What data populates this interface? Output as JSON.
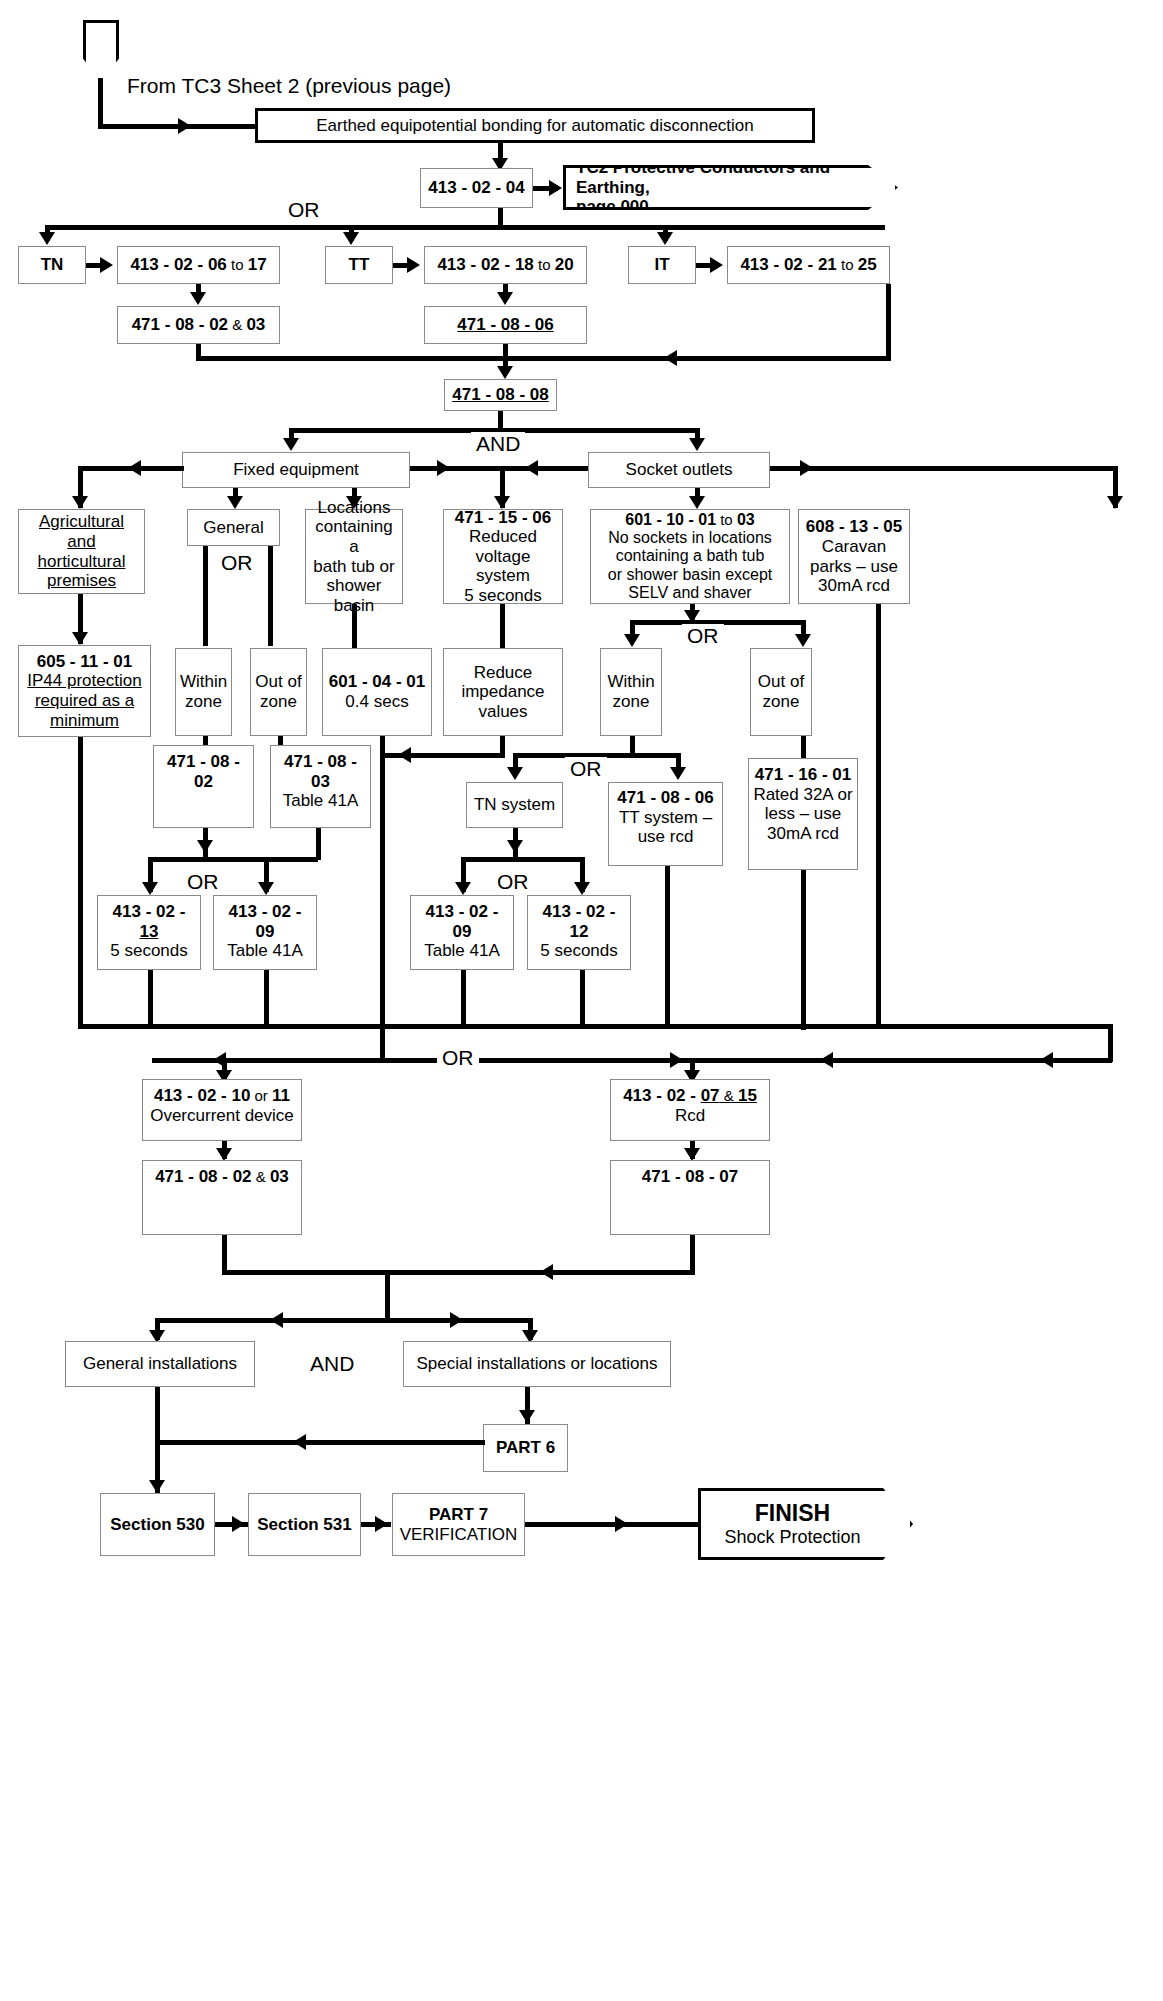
{
  "diagram": {
    "entry_label": "From TC3 Sheet 2 (previous page)",
    "logic_labels": {
      "or1": "OR",
      "or2": "OR",
      "and1": "AND",
      "or_general": "OR",
      "or_sockets": "OR",
      "or_within": "OR",
      "or_tn": "OR",
      "or_bottom": "OR",
      "and_bottom": "AND"
    }
  },
  "nodes": {
    "start_tag": "",
    "earthed_bonding": "Earthed equipotential bonding for automatic disconnection",
    "reg_413_02_04": "413 - 02 - 04",
    "tc2_pointer_l1": "TC2 Protective Conductors and Earthing,",
    "tc2_pointer_l2": "page 000",
    "tn": "TN",
    "tt": "TT",
    "it": "IT",
    "reg_413_02_06": "413 - 02 - 06",
    "reg_413_02_06_to": " to ",
    "reg_413_02_06_end": "17",
    "reg_413_02_18": "413 - 02 - 18",
    "reg_413_02_18_to": " to ",
    "reg_413_02_18_end": "20",
    "reg_413_02_21": "413 - 02 - 21",
    "reg_413_02_21_to": " to ",
    "reg_413_02_21_end": "25",
    "reg_471_08_02_03_a": "471 - 08 - 02",
    "reg_471_08_02_03_a_amp": " & ",
    "reg_471_08_02_03_a_end": "03",
    "reg_471_08_06_tt": "471 - 08 - 06",
    "reg_471_08_08": "471 - 08 - 08",
    "fixed_equipment": "Fixed equipment",
    "socket_outlets": "Socket outlets",
    "agricultural_l1": "Agricultural and",
    "agricultural_l2": "horticultural",
    "agricultural_l3": "premises",
    "general": "General",
    "locations_bath_l1": "Locations",
    "locations_bath_l2": "containing a",
    "locations_bath_l3": "bath tub or",
    "locations_bath_l4": "shower basin",
    "reg_471_15_06": "471 - 15 - 06",
    "reg_471_15_06_l2": "Reduced",
    "reg_471_15_06_l3": "voltage system",
    "reg_471_15_06_l4": "5 seconds",
    "reg_601_10_01": "601 - 10 - 01",
    "reg_601_10_01_to": " to ",
    "reg_601_10_01_end": "03",
    "reg_601_10_01_l2": "No sockets in locations",
    "reg_601_10_01_l3": "containing a bath tub",
    "reg_601_10_01_l4": "or shower basin except",
    "reg_601_10_01_l5": "SELV and shaver",
    "reg_608_13_05": "608 - 13 - 05",
    "reg_608_13_05_l2": "Caravan",
    "reg_608_13_05_l3": "parks – use",
    "reg_608_13_05_l4": "30mA rcd",
    "reg_605_11_01": "605 - 11 - 01",
    "reg_605_11_01_l2": "IP44 protection",
    "reg_605_11_01_l3": "required as a",
    "reg_605_11_01_l4": "minimum",
    "within_zone_1_l1": "Within",
    "within_zone_1_l2": "zone",
    "out_of_zone_1_l1": "Out of",
    "out_of_zone_1_l2": "zone",
    "reg_601_04_01": "601 - 04 - 01",
    "reg_601_04_01_l2": "0.4 secs",
    "reduce_impedance_l1": "Reduce",
    "reduce_impedance_l2": "impedance",
    "reduce_impedance_l3": "values",
    "within_zone_2_l1": "Within",
    "within_zone_2_l2": "zone",
    "out_of_zone_2_l1": "Out of",
    "out_of_zone_2_l2": "zone",
    "reg_471_08_02": "471 - 08 - 02",
    "reg_471_08_03": "471 - 08 - 03",
    "reg_471_08_03_l2": "Table 41A",
    "reg_471_16_01": "471 - 16 - 01",
    "reg_471_16_01_l2": "Rated 32A or",
    "reg_471_16_01_l3": "less – use",
    "reg_471_16_01_l4": "30mA rcd",
    "tn_system": "TN system",
    "reg_471_08_06_tt2": "471 - 08 - 06",
    "reg_471_08_06_tt2_l2": "TT system –",
    "reg_471_08_06_tt2_l3": "use rcd",
    "reg_413_02_13": "413 - 02 - ",
    "reg_413_02_13_u": "13",
    "reg_413_02_13_l2": "5 seconds",
    "reg_413_02_09_a": "413 - 02 - 09",
    "reg_413_02_09_a_l2": "Table 41A",
    "reg_413_02_09_b": "413 - 02 - 09",
    "reg_413_02_09_b_l2": "Table 41A",
    "reg_413_02_12": "413 - 02 - 12",
    "reg_413_02_12_l2": "5 seconds",
    "reg_413_02_10": "413 - 02 - 10",
    "reg_413_02_10_or": " or ",
    "reg_413_02_10_end": "11",
    "reg_413_02_10_l2": "Overcurrent device",
    "reg_413_02_07": "413 - 02 - ",
    "reg_413_02_07_u": "07",
    "reg_413_02_07_amp": " & ",
    "reg_413_02_07_end": "15",
    "reg_413_02_07_l2": "Rcd",
    "reg_471_08_02_03_b": "471 - 08 - 02",
    "reg_471_08_02_03_b_amp": " & ",
    "reg_471_08_02_03_b_end": "03",
    "reg_471_08_07": "471 - 08 - 07",
    "general_installations": "General installations",
    "special_installations": "Special installations or locations",
    "part6": "PART 6",
    "section530": "Section 530",
    "section531": "Section 531",
    "part7": "PART 7",
    "part7_l2": "VERIFICATION",
    "finish": "FINISH",
    "finish_l2": "Shock Protection"
  }
}
